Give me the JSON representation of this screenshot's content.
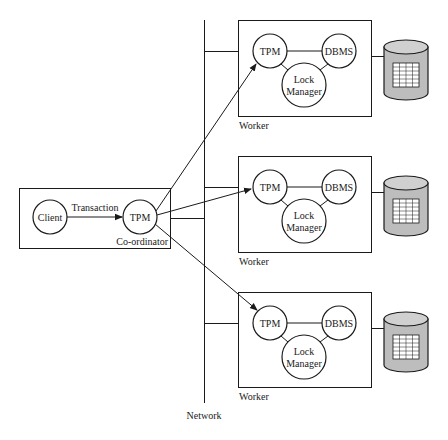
{
  "diagram": {
    "network": {
      "label": "Network"
    },
    "coordinator": {
      "label": "Co-ordinator",
      "client": {
        "label": "Client"
      },
      "tpm": {
        "label": "TPM"
      },
      "edge_label": "Transaction"
    },
    "workers": [
      {
        "label": "Worker",
        "tpm": {
          "label": "TPM"
        },
        "dbms": {
          "label": "DBMS"
        },
        "lock_manager": {
          "line1": "Lock",
          "line2": "Manager"
        }
      },
      {
        "label": "Worker",
        "tpm": {
          "label": "TPM"
        },
        "dbms": {
          "label": "DBMS"
        },
        "lock_manager": {
          "line1": "Lock",
          "line2": "Manager"
        }
      },
      {
        "label": "Worker",
        "tpm": {
          "label": "TPM"
        },
        "dbms": {
          "label": "DBMS"
        },
        "lock_manager": {
          "line1": "Lock",
          "line2": "Manager"
        }
      }
    ],
    "colors": {
      "stroke": "#1a1a1a",
      "database_fill": "#bdbdbd",
      "database_top": "#d0d0d0",
      "table_fill": "#ffffff"
    }
  }
}
